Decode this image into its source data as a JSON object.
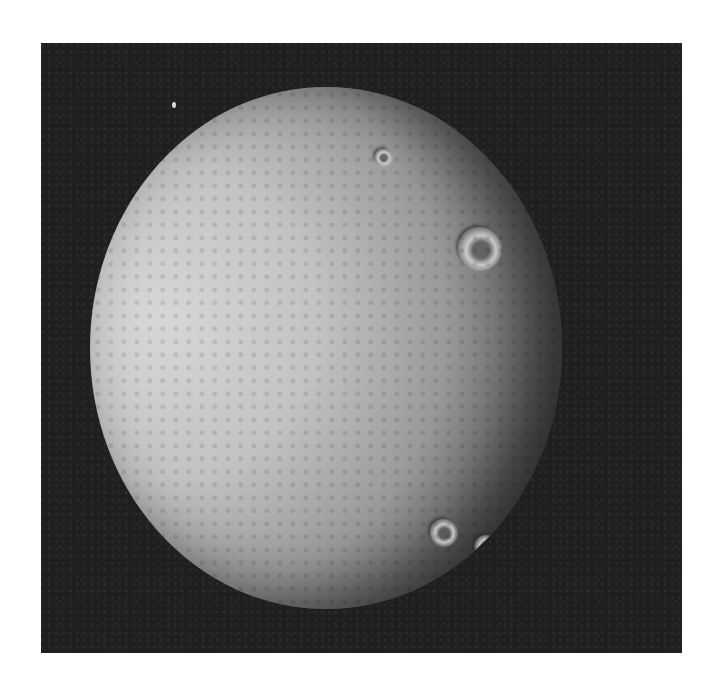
{
  "image": {
    "subject": "cratered icy moon (grayscale space photograph)",
    "background_color": "#ffffff",
    "frame_color": "#1f1f1f",
    "frame": {
      "left": 41,
      "top": 43,
      "width": 641,
      "height": 610
    }
  },
  "moon": {
    "center_x": 285,
    "center_y": 305,
    "radius_x": 236,
    "radius_y": 261,
    "lit_color": "#d7d7d7",
    "terminator_color": "#2a2a2a"
  },
  "craters": [
    {
      "name": "large-crater-north",
      "x": 368,
      "y": 140,
      "size": 42
    },
    {
      "name": "crater-south-1",
      "x": 340,
      "y": 432,
      "size": 26
    },
    {
      "name": "crater-south-2",
      "x": 384,
      "y": 448,
      "size": 24
    },
    {
      "name": "crater-south-3",
      "x": 413,
      "y": 457,
      "size": 34
    },
    {
      "name": "crater-east",
      "x": 442,
      "y": 390,
      "size": 30
    },
    {
      "name": "crater-north-small",
      "x": 285,
      "y": 62,
      "size": 16
    }
  ],
  "star": {
    "x": 131,
    "y": 59
  }
}
